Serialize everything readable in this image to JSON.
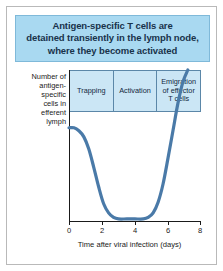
{
  "figure": {
    "header_title": "Antigen-specific T cells are\ndetained transiently in the lymph node,\nwhere they become activated",
    "colors": {
      "header_background": "#a9d9f1",
      "header_border": "#7fb9d9",
      "phase_box_background": "#cbe6f5",
      "phase_box_border": "#5b87a8",
      "curve": "#4a7aa8",
      "axis": "#1a1a1a",
      "frame_border": "#b9b9b9"
    }
  },
  "chart_data": {
    "type": "line",
    "title": "Antigen-specific T cells are detained transiently in the lymph node, where they become activated",
    "xlabel": "Time after viral infection (days)",
    "ylabel": "Number of antigen-specific cells in efferent lymph",
    "xlim": [
      0,
      8
    ],
    "ylim": [
      0,
      1
    ],
    "xticks": [
      0,
      2,
      4,
      6,
      8
    ],
    "xtick_labels": [
      "0",
      "2",
      "4",
      "6",
      "8"
    ],
    "yticks": [],
    "ytick_labels": [],
    "grid": false,
    "legend": false,
    "series": [
      {
        "name": "Antigen-specific cells in efferent lymph",
        "x": [
          0.0,
          0.3,
          0.6,
          0.9,
          1.2,
          1.5,
          1.8,
          2.1,
          2.4,
          2.7,
          3.0,
          3.5,
          4.0,
          4.5,
          4.8,
          5.1,
          5.4,
          5.7,
          6.0,
          6.3,
          6.6,
          6.9,
          7.2
        ],
        "values": [
          0.62,
          0.62,
          0.6,
          0.56,
          0.48,
          0.36,
          0.23,
          0.12,
          0.06,
          0.03,
          0.02,
          0.02,
          0.02,
          0.02,
          0.03,
          0.06,
          0.13,
          0.25,
          0.42,
          0.6,
          0.78,
          0.92,
          1.0
        ]
      }
    ],
    "phases": [
      {
        "label": "Trapping",
        "x_start": 0,
        "x_end": 2.65
      },
      {
        "label": "Activation",
        "x_start": 2.65,
        "x_end": 5.35
      },
      {
        "label": "Emigration\nof effector\nT cells",
        "x_start": 5.35,
        "x_end": 8
      }
    ],
    "annotations": []
  },
  "axis": {
    "y_title": "Number of\nantigen-\nspecific\ncells in\nefferent\nlymph",
    "x_title": "Time after viral infection (days)"
  }
}
